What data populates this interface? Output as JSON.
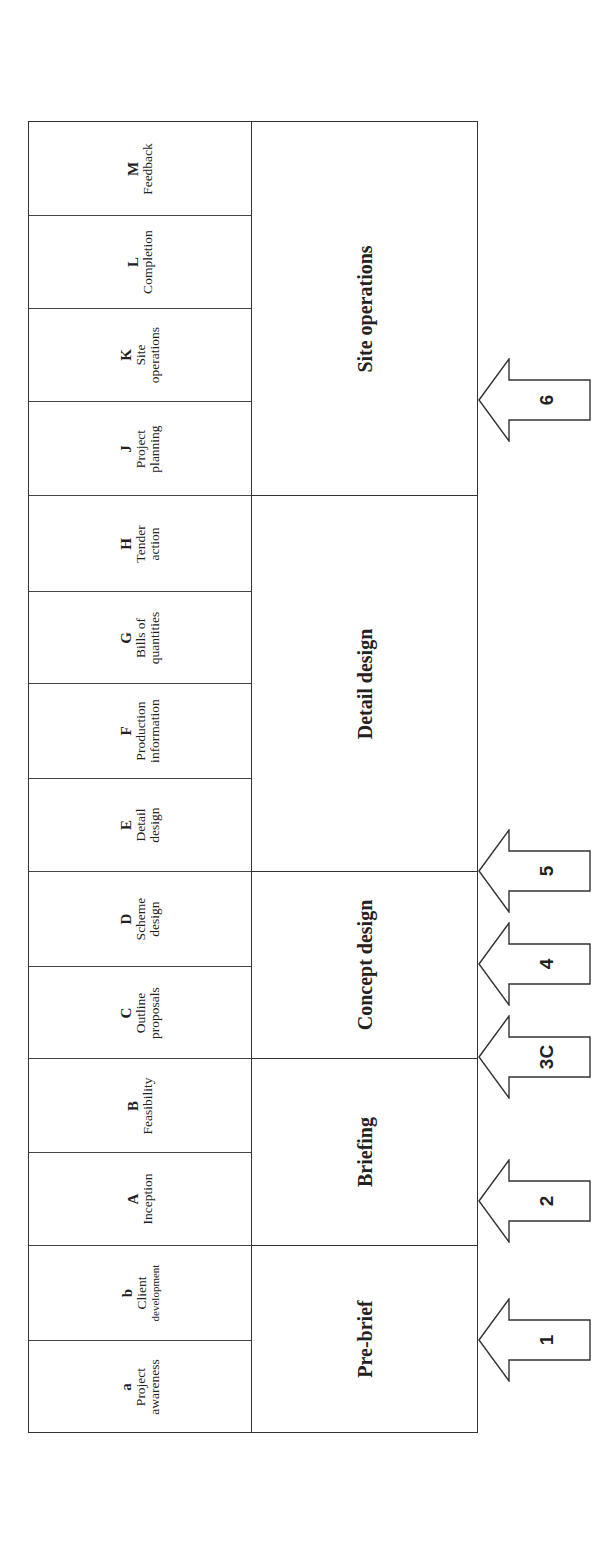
{
  "diagram": {
    "orientation": "rotated-90-ccw",
    "stages": [
      {
        "code": "M",
        "lines": [
          "Feedback"
        ]
      },
      {
        "code": "L",
        "lines": [
          "Completion"
        ]
      },
      {
        "code": "K",
        "lines": [
          "Site",
          "operations"
        ]
      },
      {
        "code": "J",
        "lines": [
          "Project",
          "planning"
        ]
      },
      {
        "code": "H",
        "lines": [
          "Tender",
          "action"
        ]
      },
      {
        "code": "G",
        "lines": [
          "Bills of",
          "quantities"
        ]
      },
      {
        "code": "F",
        "lines": [
          "Production",
          "information"
        ]
      },
      {
        "code": "E",
        "lines": [
          "Detail",
          "design"
        ]
      },
      {
        "code": "D",
        "lines": [
          "Scheme",
          "design"
        ]
      },
      {
        "code": "C",
        "lines": [
          "Outline",
          "proposals"
        ]
      },
      {
        "code": "B",
        "lines": [
          "Feasibility"
        ]
      },
      {
        "code": "A",
        "lines": [
          "Inception"
        ]
      },
      {
        "code": "b",
        "lines": [
          "Client",
          "development"
        ]
      },
      {
        "code": "a",
        "lines": [
          "Project",
          "awareness"
        ]
      }
    ],
    "phases": [
      {
        "label": "Site operations",
        "stages": [
          "M",
          "L",
          "K",
          "J"
        ]
      },
      {
        "label": "Detail design",
        "stages": [
          "H",
          "G",
          "F",
          "E"
        ]
      },
      {
        "label": "Concept design",
        "stages": [
          "D",
          "C"
        ]
      },
      {
        "label": "Briefing",
        "stages": [
          "B",
          "A"
        ]
      },
      {
        "label": "Pre-brief",
        "stages": [
          "b",
          "a"
        ]
      }
    ],
    "arrows": [
      {
        "label": "6",
        "points_to": "start of Site operations"
      },
      {
        "label": "5",
        "points_to": "start of Detail design"
      },
      {
        "label": "4",
        "points_to": "between C and D"
      },
      {
        "label": "3C",
        "points_to": "start of Concept design"
      },
      {
        "label": "2",
        "points_to": "Briefing"
      },
      {
        "label": "1",
        "points_to": "Pre-brief"
      }
    ]
  }
}
